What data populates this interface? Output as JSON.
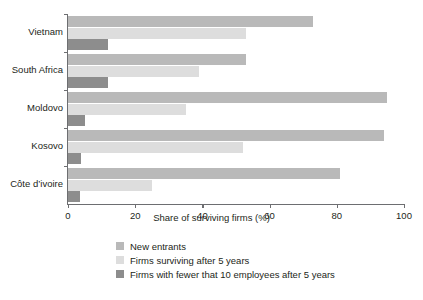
{
  "chart_data": {
    "type": "bar",
    "orientation": "horizontal",
    "title": "",
    "xlabel": "Share of surviving firms (%)",
    "ylabel": "",
    "xlim": [
      0,
      100
    ],
    "xticks": [
      0,
      20,
      40,
      60,
      80,
      100
    ],
    "grid": false,
    "legend_position": "bottom",
    "categories": [
      "Vietnam",
      "South Africa",
      "Moldovo",
      "Kosovo",
      "Côte d’ivoire"
    ],
    "series": [
      {
        "name": "New entrants",
        "color": "#b9b9b9",
        "values": [
          73,
          53,
          95,
          94,
          81
        ]
      },
      {
        "name": "Firms surviving after 5 years",
        "color": "#dddddd",
        "values": [
          53,
          39,
          35,
          52,
          25
        ]
      },
      {
        "name": "Firms with fewer that 10 employees after 5 years",
        "color": "#8d8d8d",
        "values": [
          12,
          12,
          5,
          4,
          3.5
        ]
      }
    ]
  },
  "axis": {
    "x_title": "Share of surviving firms (%)",
    "tick_labels": [
      "0",
      "20",
      "40",
      "60",
      "80",
      "100"
    ]
  },
  "legend": {
    "items": [
      {
        "label": "New entrants",
        "color": "#b9b9b9"
      },
      {
        "label": "Firms surviving after 5 years",
        "color": "#dddddd"
      },
      {
        "label": "Firms with fewer that 10 employees after 5 years",
        "color": "#8d8d8d"
      }
    ]
  },
  "colors": {
    "new_entrants": "#b9b9b9",
    "surviving": "#dddddd",
    "small_firms": "#8d8d8d",
    "axis": "#6d6e71",
    "text": "#231f20",
    "background": "#ffffff"
  }
}
